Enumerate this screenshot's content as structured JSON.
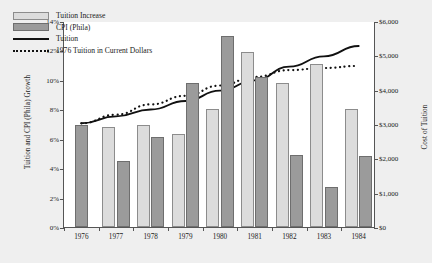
{
  "chart_data": {
    "type": "bar",
    "title": "",
    "xlabel": "",
    "ylabel": "Tuition and CPI (Phila) Growth",
    "ylabel_right": "Cost of Tuition",
    "categories": [
      "1976",
      "1977",
      "1978",
      "1979",
      "1980",
      "1981",
      "1982",
      "1983",
      "1984"
    ],
    "ylim": [
      0,
      14
    ],
    "ylim_right": [
      0,
      6000
    ],
    "yticks": [
      "0%",
      "2%",
      "4%",
      "6%",
      "8%",
      "10%",
      "12%",
      "14%"
    ],
    "ytick_values": [
      0,
      2,
      4,
      6,
      8,
      10,
      12,
      14
    ],
    "yticks_right": [
      "$0",
      "$1,000",
      "$2,000",
      "$3,000",
      "$4,000",
      "$5,000",
      "$6,000"
    ],
    "ytick_values_right": [
      0,
      1000,
      2000,
      3000,
      4000,
      5000,
      6000
    ],
    "grid": false,
    "legend_position": "top-left",
    "series": [
      {
        "name": "Tuition Increase",
        "type": "bar",
        "axis": "left",
        "color": "#dcdcdc",
        "values": [
          null,
          6.8,
          6.9,
          6.3,
          8.0,
          11.9,
          9.8,
          11.1,
          8.0
        ]
      },
      {
        "name": "CPI (Phila)",
        "type": "bar",
        "axis": "left",
        "color": "#9b9b9b",
        "values": [
          6.9,
          4.5,
          6.1,
          9.8,
          13.0,
          10.2,
          4.9,
          2.7,
          4.8
        ]
      },
      {
        "name": "Tuition",
        "type": "line",
        "axis": "right",
        "color": "#111111",
        "values": [
          3050,
          3250,
          3450,
          3700,
          4000,
          4300,
          4700,
          5000,
          5300
        ]
      },
      {
        "name": "1976 Tuition in Current Dollars",
        "type": "line",
        "axis": "right",
        "color": "#111111",
        "style": "dotted",
        "values": [
          3050,
          3300,
          3600,
          3850,
          4150,
          4400,
          4600,
          4660,
          4720
        ]
      }
    ]
  },
  "legend": {
    "items": [
      {
        "label": "Tuition Increase",
        "key": "swatch-light"
      },
      {
        "label": "CPI (Phila)",
        "key": "swatch-dark"
      },
      {
        "label": "Tuition",
        "key": "line-solid"
      },
      {
        "label": "1976 Tuition in Current Dollars",
        "key": "line-dotted"
      }
    ]
  }
}
